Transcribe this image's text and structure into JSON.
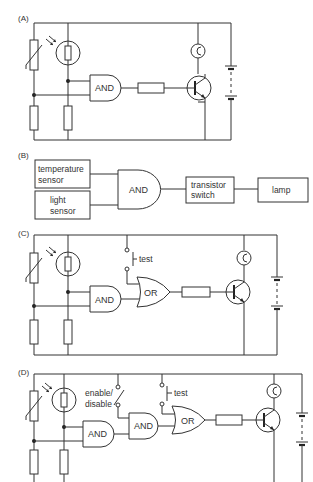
{
  "sections": {
    "a": {
      "label": "(A)",
      "gate": "AND"
    },
    "b": {
      "label": "(B)",
      "temp_sensor": [
        "temperature",
        "sensor"
      ],
      "light_sensor": [
        "light",
        "sensor"
      ],
      "gate": "AND",
      "switch": [
        "transistor",
        "switch"
      ],
      "lamp": "lamp"
    },
    "c": {
      "label": "(C)",
      "and_gate": "AND",
      "or_gate": "OR",
      "test_label": "test"
    },
    "d": {
      "label": "(D)",
      "and_gate_1": "AND",
      "and_gate_2": "AND",
      "or_gate": "OR",
      "test_label": "test",
      "enable_label": [
        "enable/",
        "disable"
      ]
    }
  }
}
